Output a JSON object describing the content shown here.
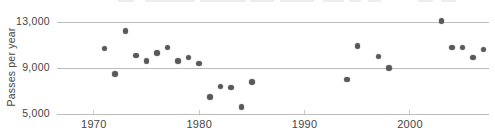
{
  "chart_data": {
    "type": "scatter",
    "title": "",
    "xlabel": "",
    "ylabel": "Passes per year",
    "xlim": [
      1966.5,
      2007.5
    ],
    "ylim": [
      5000,
      13000
    ],
    "grid": "horizontal-only",
    "legend": "none",
    "yticks": [
      {
        "value": 13000,
        "label": "13,000"
      },
      {
        "value": 9000,
        "label": "9,000"
      },
      {
        "value": 5000,
        "label": "5,000"
      }
    ],
    "xticks": [
      {
        "value": 1970,
        "label": "1970"
      },
      {
        "value": 1980,
        "label": "1980"
      },
      {
        "value": 1990,
        "label": "1990"
      },
      {
        "value": 2000,
        "label": "2000"
      }
    ],
    "points": [
      {
        "year": 1971,
        "value": 10700
      },
      {
        "year": 1972,
        "value": 8500
      },
      {
        "year": 1973,
        "value": 12200
      },
      {
        "year": 1974,
        "value": 10100
      },
      {
        "year": 1975,
        "value": 9600
      },
      {
        "year": 1976,
        "value": 10300
      },
      {
        "year": 1977,
        "value": 10800
      },
      {
        "year": 1978,
        "value": 9600
      },
      {
        "year": 1979,
        "value": 9900
      },
      {
        "year": 1980,
        "value": 9400
      },
      {
        "year": 1981,
        "value": 6500
      },
      {
        "year": 1982,
        "value": 7400
      },
      {
        "year": 1983,
        "value": 7300
      },
      {
        "year": 1984,
        "value": 5600
      },
      {
        "year": 1985,
        "value": 7800
      },
      {
        "year": 1994,
        "value": 8000
      },
      {
        "year": 1995,
        "value": 10900
      },
      {
        "year": 1997,
        "value": 10000
      },
      {
        "year": 1998,
        "value": 9000
      },
      {
        "year": 2003,
        "value": 13100
      },
      {
        "year": 2004,
        "value": 10800
      },
      {
        "year": 2005,
        "value": 10800
      },
      {
        "year": 2006,
        "value": 9900
      },
      {
        "year": 2007,
        "value": 10600
      }
    ],
    "colors": {
      "point": "#59595b",
      "gridline": "#bdbdbd",
      "tick": "#c9c9c9",
      "text": "#454545",
      "background": "#ffffff"
    }
  }
}
